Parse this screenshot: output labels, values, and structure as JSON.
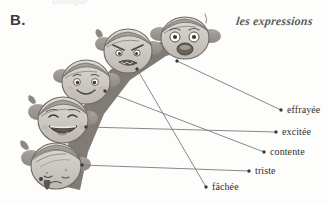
{
  "page": {
    "exercise_letter": "B.",
    "column_heading": "les expressions",
    "top_cut_text": "Dialogue",
    "background_color": "#fdfdfc",
    "ink_color": "#2e2e2e",
    "line_color": "#7a7a7a"
  },
  "faces": [
    {
      "id": "face-effrayee",
      "emotion_name": "effrayée",
      "description": "frightened face, wide eyes, open mouth",
      "cx": 185,
      "cy": 38,
      "rx": 24,
      "ry": 21,
      "dot_x": 177,
      "dot_y": 61
    },
    {
      "id": "face-fachee",
      "emotion_name": "fâchée",
      "description": "angry face, furrowed brows, gritted teeth",
      "cx": 128,
      "cy": 51,
      "rx": 24,
      "ry": 22,
      "dot_x": 137,
      "dot_y": 69
    },
    {
      "id": "face-contente",
      "emotion_name": "contente",
      "description": "happy content face, smiling",
      "cx": 86,
      "cy": 82,
      "rx": 24,
      "ry": 22,
      "dot_x": 105,
      "dot_y": 91
    },
    {
      "id": "face-excitee",
      "emotion_name": "excitée",
      "description": "excited face, big open laughing smile",
      "cx": 63,
      "cy": 120,
      "rx": 25,
      "ry": 23,
      "dot_x": 86,
      "dot_y": 127
    },
    {
      "id": "face-triste",
      "emotion_name": "triste",
      "description": "sad face, looking down, tear",
      "cx": 56,
      "cy": 166,
      "rx": 25,
      "ry": 23,
      "dot_x": 82,
      "dot_y": 165
    }
  ],
  "labels": [
    {
      "id": "label-effrayee",
      "text": "effrayée",
      "dot_x": 281,
      "dot_y": 110,
      "text_x": 287,
      "text_y": 105
    },
    {
      "id": "label-excitee",
      "text": "excitée",
      "dot_x": 276,
      "dot_y": 132,
      "text_x": 282,
      "text_y": 127
    },
    {
      "id": "label-contente",
      "text": "contente",
      "dot_x": 264,
      "dot_y": 152,
      "text_x": 270,
      "text_y": 147
    },
    {
      "id": "label-triste",
      "text": "triste",
      "dot_x": 249,
      "dot_y": 171,
      "text_x": 255,
      "text_y": 166
    },
    {
      "id": "label-fachee",
      "text": "fâchée",
      "dot_x": 206,
      "dot_y": 187,
      "text_x": 212,
      "text_y": 182
    }
  ],
  "connections": [
    {
      "id": "line-effrayee-to-label",
      "from_face": "face-effrayee",
      "to_label": "label-effrayee",
      "x1": 177,
      "y1": 61,
      "x2": 281,
      "y2": 110
    },
    {
      "id": "line-fachee-to-label",
      "from_face": "face-fachee",
      "to_label": "label-fachee",
      "x1": 137,
      "y1": 69,
      "x2": 206,
      "y2": 187
    },
    {
      "id": "line-contente-to-label",
      "from_face": "face-contente",
      "to_label": "label-contente",
      "x1": 105,
      "y1": 91,
      "x2": 264,
      "y2": 152
    },
    {
      "id": "line-excitee-to-label",
      "from_face": "face-excitee",
      "to_label": "label-excitee",
      "x1": 86,
      "y1": 127,
      "x2": 276,
      "y2": 132
    },
    {
      "id": "line-triste-to-label",
      "from_face": "face-triste",
      "to_label": "label-triste",
      "x1": 82,
      "y1": 165,
      "x2": 249,
      "y2": 171
    }
  ]
}
